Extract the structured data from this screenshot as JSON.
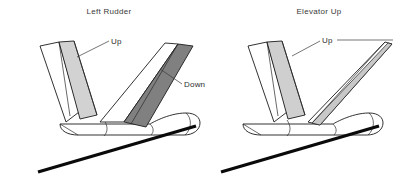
{
  "figure": {
    "type": "technical-diagram",
    "background_color": "#ffffff",
    "line_color": "#1c1c1c"
  },
  "panels": [
    {
      "id": "left-rudder",
      "title": "Left Rudder",
      "callouts": [
        {
          "id": "left-up",
          "label": "Up",
          "surface": "rudder",
          "shade": "light"
        },
        {
          "id": "left-down",
          "label": "Down",
          "surface": "elevator",
          "shade": "dark"
        }
      ]
    },
    {
      "id": "elevator-up",
      "title": "Elevator Up",
      "callouts": [
        {
          "id": "right-up",
          "label": "Up",
          "surface": "elevator",
          "shade": "light"
        }
      ]
    }
  ],
  "shading": {
    "light_gray": "#d2d2d2",
    "mid_gray": "#c8c8c8",
    "dark_gray": "#808080",
    "white": "#ffffff",
    "black": "#0a0a0a"
  },
  "labels": {
    "title_left": "Left Rudder",
    "title_right": "Elevator Up",
    "left_up": "Up",
    "left_down": "Down",
    "right_up": "Up"
  }
}
